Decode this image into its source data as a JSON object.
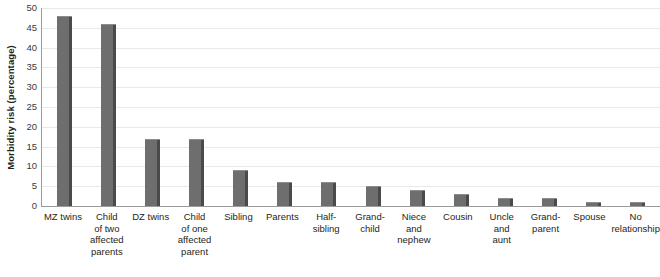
{
  "chart_data": {
    "type": "bar",
    "title": "",
    "xlabel": "",
    "ylabel": "Morbidity risk (percentage)",
    "ylim": [
      0,
      50
    ],
    "ytick_step": 5,
    "yticks": [
      "50",
      "45",
      "40",
      "35",
      "30",
      "25",
      "20",
      "15",
      "10",
      "5",
      "0"
    ],
    "grid": true,
    "legend": "none",
    "bar_color": "#6e6e6e",
    "bar_shade_color": "#4a4a4a",
    "gridline_color": "#e9e9e9",
    "axis_color": "#9a9a9a",
    "categories": [
      "MZ twins",
      "Child of two affected parents",
      "DZ twins",
      "Child of one affected parent",
      "Sibling",
      "Parents",
      "Half-sibling",
      "Grand-child",
      "Niece and nephew",
      "Cousin",
      "Uncle and aunt",
      "Grand-parent",
      "Spouse",
      "No relationship"
    ],
    "category_label_lines": [
      [
        "MZ twins"
      ],
      [
        "Child",
        "of two",
        "affected",
        "parents"
      ],
      [
        "DZ twins"
      ],
      [
        "Child",
        "of one",
        "affected",
        "parent"
      ],
      [
        "Sibling"
      ],
      [
        "Parents"
      ],
      [
        "Half-",
        "sibling"
      ],
      [
        "Grand-",
        "child"
      ],
      [
        "Niece",
        "and",
        "nephew"
      ],
      [
        "Cousin"
      ],
      [
        "Uncle",
        "and",
        "aunt"
      ],
      [
        "Grand-",
        "parent"
      ],
      [
        "Spouse"
      ],
      [
        "No",
        "relationship"
      ]
    ],
    "values": [
      48,
      46,
      17,
      17,
      9,
      6,
      6,
      5,
      4,
      3,
      2,
      2,
      1,
      1
    ]
  }
}
